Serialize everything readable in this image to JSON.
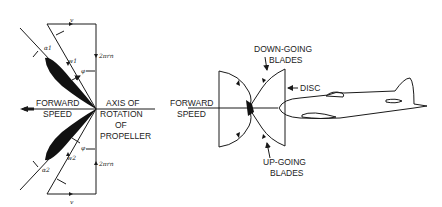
{
  "left_diagram": {
    "labels": {
      "forward_speed_1": "FORWARD",
      "forward_speed_2": "SPEED",
      "axis_1": "AXIS OF",
      "axis_2": "ROTATION",
      "axis_3": "OF",
      "axis_4": "PROPELLER"
    },
    "symbols": {
      "v_top": "v",
      "v_bottom": "v",
      "alpha1": "α1",
      "alpha2": "α2",
      "w1": "w1",
      "w2": "w2",
      "phi1": "φ",
      "phi2": "φ",
      "rot_top": "2πrn",
      "rot_bottom": "2πrn"
    }
  },
  "right_diagram": {
    "labels": {
      "forward_speed_1": "FORWARD",
      "forward_speed_2": "SPEED",
      "down_going_1": "DOWN-GOING",
      "down_going_2": "BLADES",
      "disc": "DISC",
      "up_going_1": "UP-GOING",
      "up_going_2": "BLADES"
    }
  }
}
